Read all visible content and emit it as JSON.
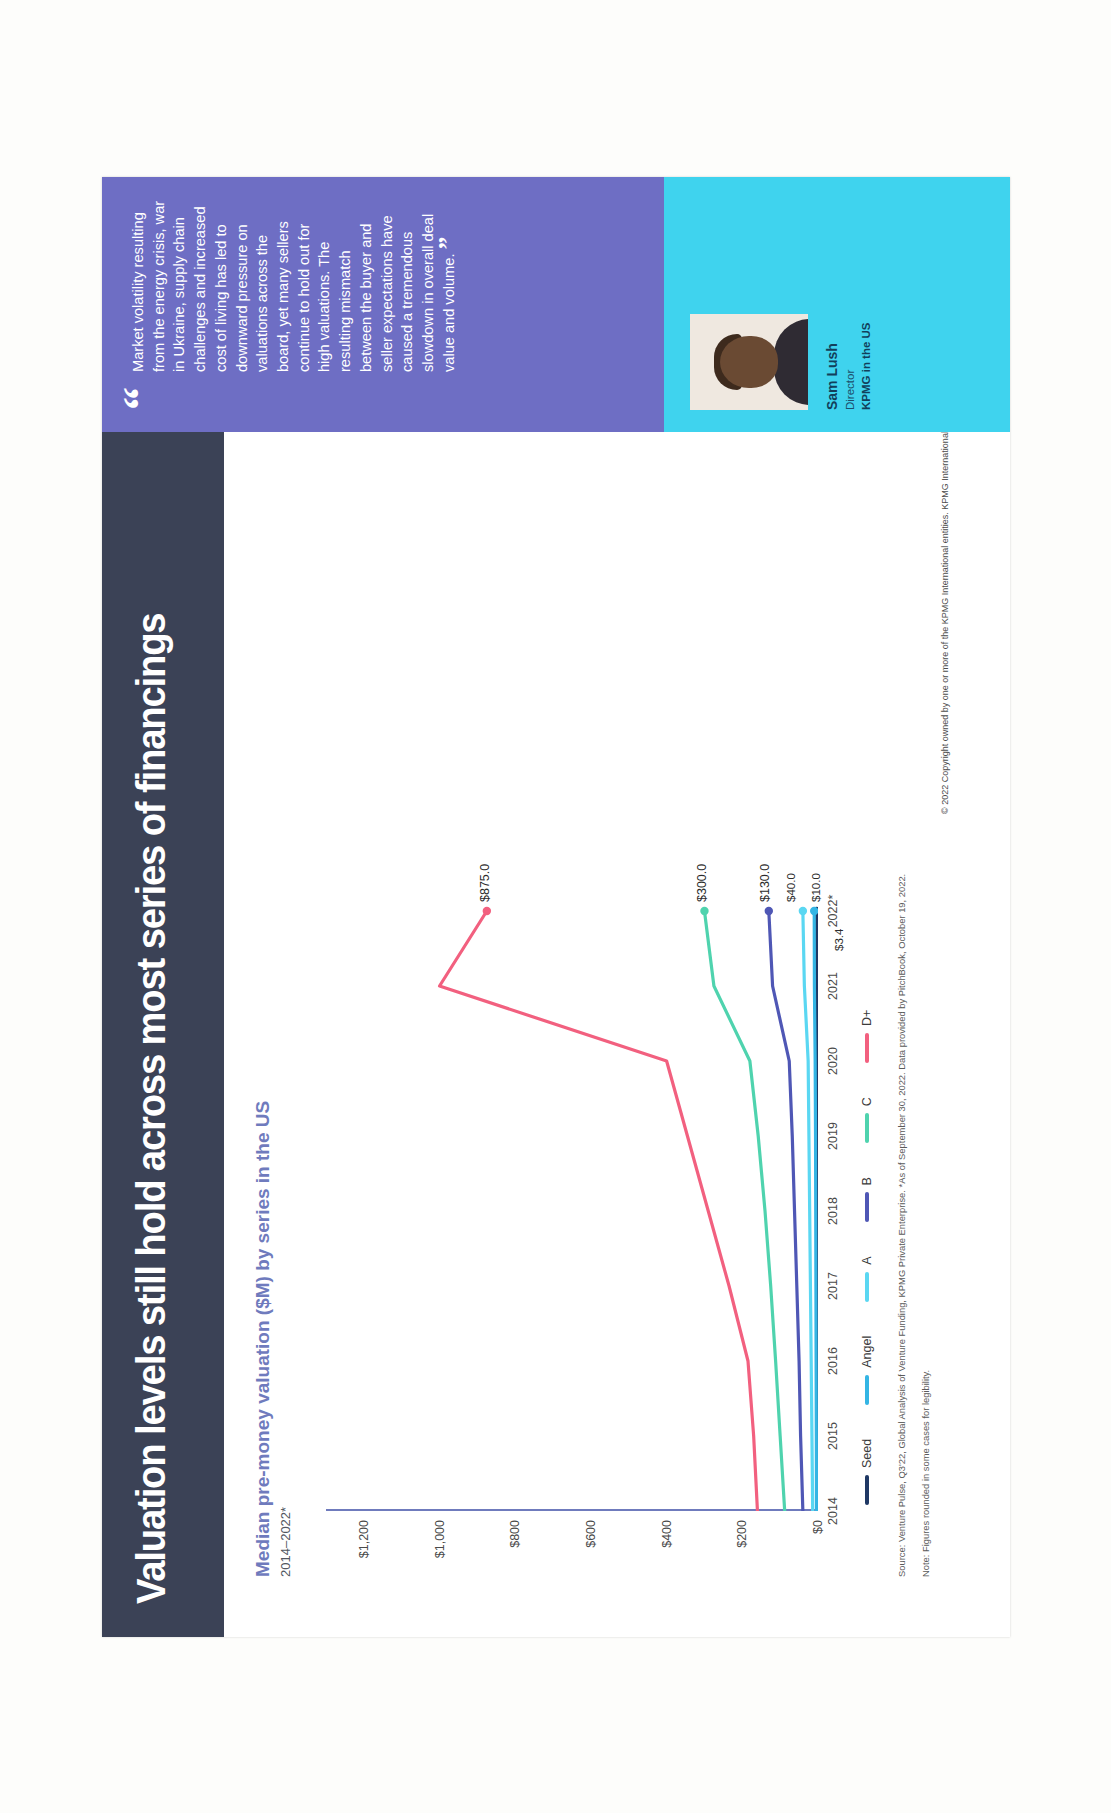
{
  "slide": {
    "title": "Valuation levels still hold across most series of financings",
    "subtitle": "Median pre-money valuation ($M) by series in the US",
    "date_range": "2014–2022*",
    "source": "Source: Venture Pulse, Q3'22, Global Analysis of Venture Funding, KPMG Private Enterprise. *As of September 30, 2022. Data provided by PitchBook, October 19, 2022.",
    "note": "Note: Figures rounded in some cases for legibility.",
    "copyright": "© 2022 Copyright owned by one or more of the KPMG International entities. KPMG International entities provide no services to clients. All rights reserved."
  },
  "quote": {
    "open_mark": "“",
    "text": "Market volatility resulting from the energy crisis, war in Ukraine, supply chain challenges and increased cost of living has led to downward pressure on valuations across the board, yet many sellers continue to hold out for high valuations. The resulting mismatch between the buyer and seller expectations have caused a tremendous slowdown in overall deal value and volume.",
    "close_mark": "”",
    "person_name": "Sam Lush",
    "person_role": "Director",
    "person_org": "KPMG in the US"
  },
  "colors": {
    "title_bar": "#3b4256",
    "subtitle": "#6f7bbd",
    "quote_panel": "#6e6ec4",
    "person_band": "#3fd3ee",
    "seed": "#1f3864",
    "angel": "#34b5e4",
    "a": "#5ad7f2",
    "b": "#4f57b5",
    "c": "#4fd3ae",
    "d_plus": "#f2607f"
  },
  "chart_data": {
    "type": "line",
    "title": "Median pre-money valuation ($M) by series in the US",
    "xlabel": "",
    "ylabel": "",
    "ylim": [
      0,
      1300
    ],
    "yticks": [
      0,
      200,
      400,
      600,
      800,
      1000,
      1200
    ],
    "ytick_labels": [
      "$0",
      "$200",
      "$400",
      "$600",
      "$800",
      "$1,000",
      "$1,200"
    ],
    "grid": false,
    "legend_position": "bottom",
    "categories": [
      "2014",
      "2015",
      "2016",
      "2017",
      "2018",
      "2019",
      "2020",
      "2021",
      "2022*"
    ],
    "xtick_labels": [
      "2014",
      "2015",
      "2016",
      "2017",
      "2018",
      "2019",
      "2020",
      "2021",
      "2022*"
    ],
    "series": [
      {
        "name": "Seed",
        "color": "#1f3864",
        "values": [
          2.0,
          2.2,
          2.4,
          2.6,
          2.8,
          3.0,
          3.1,
          3.3,
          3.4
        ],
        "end_label": "$3.4"
      },
      {
        "name": "Angel",
        "color": "#34b5e4",
        "values": [
          4.0,
          4.4,
          5.0,
          5.5,
          6.0,
          6.5,
          7.5,
          9.5,
          10.0
        ],
        "end_label": "$10.0"
      },
      {
        "name": "A",
        "color": "#5ad7f2",
        "values": [
          14.0,
          16.0,
          18.0,
          20.0,
          22.0,
          24.0,
          26.0,
          36.0,
          40.0
        ],
        "end_label": "$40.0"
      },
      {
        "name": "B",
        "color": "#4f57b5",
        "values": [
          40.0,
          46.0,
          50.0,
          56.0,
          62.0,
          68.0,
          76.0,
          120.0,
          130.0
        ],
        "end_label": "$130.0"
      },
      {
        "name": "C",
        "color": "#4fd3ae",
        "values": [
          88.0,
          100.0,
          112.0,
          125.0,
          140.0,
          158.0,
          180.0,
          275.0,
          300.0
        ],
        "end_label": "$300.0"
      },
      {
        "name": "D+",
        "color": "#f2607f",
        "values": [
          160.0,
          170.0,
          185.0,
          235.0,
          290.0,
          345.0,
          400.0,
          1000.0,
          875.0
        ],
        "end_label": "$875.0"
      }
    ],
    "legend": [
      "Seed",
      "Angel",
      "A",
      "B",
      "C",
      "D+"
    ]
  }
}
